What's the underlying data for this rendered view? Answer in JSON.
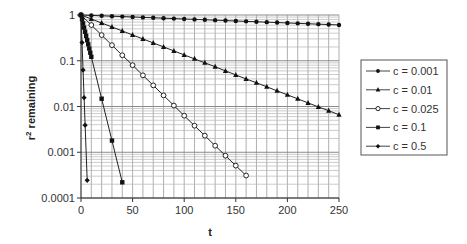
{
  "chart_data": {
    "type": "line",
    "title": "",
    "xlabel": "t",
    "ylabel": "r² remaining",
    "ylabel_base": "r",
    "ylabel_sup": "2",
    "ylabel_rest": " remaining",
    "xlim": [
      0,
      250
    ],
    "ylim": [
      0.0001,
      1
    ],
    "yscale": "log",
    "grid": true,
    "legend_position": "right",
    "x_ticks": [
      0,
      50,
      100,
      150,
      200,
      250
    ],
    "x_tick_labels": [
      "0",
      "50",
      "100",
      "150",
      "200",
      "250"
    ],
    "y_ticks": [
      1,
      0.1,
      0.01,
      0.001,
      0.0001
    ],
    "y_tick_labels": [
      "1",
      "0.1",
      "0.01",
      "0.001",
      "0.0001"
    ],
    "series": [
      {
        "name": "c = 0.001",
        "marker": "circle-filled",
        "x": [
          0,
          10,
          20,
          30,
          40,
          50,
          60,
          70,
          80,
          90,
          100,
          110,
          120,
          130,
          140,
          150,
          160,
          170,
          180,
          190,
          200,
          210,
          220,
          230,
          240,
          250
        ],
        "y": [
          1,
          0.98,
          0.961,
          0.942,
          0.923,
          0.905,
          0.887,
          0.869,
          0.852,
          0.835,
          0.819,
          0.802,
          0.787,
          0.771,
          0.756,
          0.741,
          0.726,
          0.712,
          0.697,
          0.684,
          0.67,
          0.657,
          0.644,
          0.631,
          0.618,
          0.606
        ]
      },
      {
        "name": "c = 0.01",
        "marker": "triangle-filled",
        "x": [
          0,
          10,
          20,
          30,
          40,
          50,
          60,
          70,
          80,
          90,
          100,
          110,
          120,
          130,
          140,
          150,
          160,
          170,
          180,
          190,
          200,
          210,
          220,
          230,
          240,
          250
        ],
        "y": [
          1,
          0.818,
          0.669,
          0.548,
          0.448,
          0.366,
          0.3,
          0.245,
          0.201,
          0.164,
          0.134,
          0.11,
          0.09,
          0.074,
          0.06,
          0.049,
          0.04,
          0.033,
          0.027,
          0.022,
          0.018,
          0.0147,
          0.012,
          0.0098,
          0.0081,
          0.0066
        ]
      },
      {
        "name": "c = 0.025",
        "marker": "circle-open",
        "x": [
          0,
          10,
          20,
          30,
          40,
          50,
          60,
          70,
          80,
          90,
          100,
          110,
          120,
          130,
          140,
          150,
          160
        ],
        "y": [
          1,
          0.603,
          0.364,
          0.219,
          0.132,
          0.08,
          0.048,
          0.029,
          0.0175,
          0.0105,
          0.0063,
          0.0038,
          0.0023,
          0.00139,
          0.00084,
          0.00051,
          0.00031
        ]
      },
      {
        "name": "c = 0.1",
        "marker": "square-filled",
        "x": [
          0,
          1,
          2,
          3,
          4,
          5,
          6,
          7,
          8,
          9,
          10,
          20,
          30,
          40
        ],
        "y": [
          1,
          0.81,
          0.656,
          0.531,
          0.43,
          0.349,
          0.282,
          0.229,
          0.185,
          0.15,
          0.122,
          0.0148,
          0.0018,
          0.00022
        ]
      },
      {
        "name": "c = 0.5",
        "marker": "diamond-filled",
        "x": [
          0,
          1,
          2,
          3,
          4,
          6
        ],
        "y": [
          1,
          0.25,
          0.0625,
          0.0156,
          0.0039,
          0.000244
        ]
      }
    ]
  }
}
